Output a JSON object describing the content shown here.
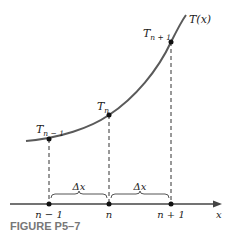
{
  "figure": {
    "caption": "FIGURE P5–7",
    "curve_label": "T(x)",
    "axis_label": "x",
    "points": [
      {
        "label": "T",
        "sub": "n − 1",
        "tick": "n − 1"
      },
      {
        "label": "T",
        "sub": "n",
        "tick": "n"
      },
      {
        "label": "T",
        "sub": "n + 1",
        "tick": "n + 1"
      }
    ],
    "spacing_labels": [
      "Δx",
      "Δx"
    ],
    "colors": {
      "curve": "#555555",
      "axis": "#333333",
      "point": "#111111",
      "caption": "#777777"
    }
  }
}
